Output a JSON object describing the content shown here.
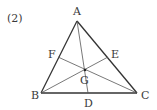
{
  "problem_number": "(2)",
  "points": {
    "A": {
      "label": "A",
      "x": 77,
      "y": 21
    },
    "B": {
      "label": "B",
      "x": 41,
      "y": 93
    },
    "C": {
      "label": "C",
      "x": 137,
      "y": 93
    },
    "D": {
      "label": "D",
      "x": 88,
      "y": 93
    },
    "E": {
      "label": "E",
      "x": 108,
      "y": 57
    },
    "F": {
      "label": "F",
      "x": 58,
      "y": 57
    },
    "G": {
      "label": "G",
      "x": 85,
      "y": 70
    }
  },
  "colors": {
    "stroke": "#333333",
    "inner_stroke": "#555555",
    "text": "#3a3a3a"
  }
}
